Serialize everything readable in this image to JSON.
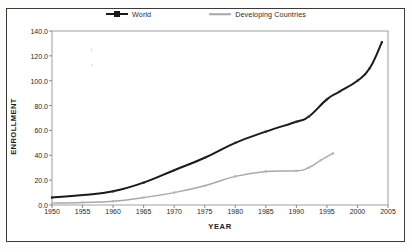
{
  "figure": {
    "border_color": "#3a3a3a"
  },
  "chart_data": {
    "type": "line",
    "title": "",
    "xlabel": "YEAR",
    "ylabel": "ENROLLMENT",
    "xlim": [
      1950,
      2005
    ],
    "ylim": [
      0.0,
      140.0
    ],
    "xticks": [
      1950,
      1955,
      1960,
      1965,
      1970,
      1975,
      1980,
      1985,
      1990,
      1995,
      2000,
      2005
    ],
    "xtick_labels": [
      "1950",
      "1955",
      "1960",
      "1965",
      "1970",
      "1975",
      "1980",
      "1985",
      "1990",
      "1995",
      "2000",
      "2005"
    ],
    "yticks": [
      0.0,
      20.0,
      40.0,
      60.0,
      80.0,
      100.0,
      120.0,
      140.0
    ],
    "ytick_labels": [
      "0.0",
      "20.0",
      "40.0",
      "60.0",
      "80.0",
      "100.0",
      "120.0",
      "140.0"
    ],
    "grid": false,
    "legend_position": "top-center",
    "series": [
      {
        "name": "World",
        "color": "#1a1a1a",
        "width": 2.0,
        "markers": true,
        "x": [
          1950,
          1955,
          1960,
          1965,
          1970,
          1975,
          1980,
          1985,
          1990,
          1992,
          1995,
          1997,
          2000,
          2002,
          2004
        ],
        "values": [
          6.0,
          8.0,
          11.0,
          18.0,
          28.0,
          38.0,
          50.0,
          59.0,
          67.0,
          71.0,
          85.0,
          91.0,
          100.0,
          110.0,
          131.0
        ]
      },
      {
        "name": "Developing Countries",
        "color": "#a8a8a8",
        "width": 1.4,
        "markers": true,
        "x": [
          1950,
          1955,
          1960,
          1965,
          1970,
          1975,
          1980,
          1985,
          1990,
          1992,
          1994,
          1996
        ],
        "values": [
          1.5,
          2.0,
          3.0,
          6.0,
          10.0,
          15.5,
          23.0,
          27.0,
          27.5,
          30.0,
          36.0,
          41.5
        ]
      }
    ]
  },
  "legend": {
    "entries": [
      {
        "label": "World"
      },
      {
        "label": "Developing Countries"
      }
    ]
  }
}
